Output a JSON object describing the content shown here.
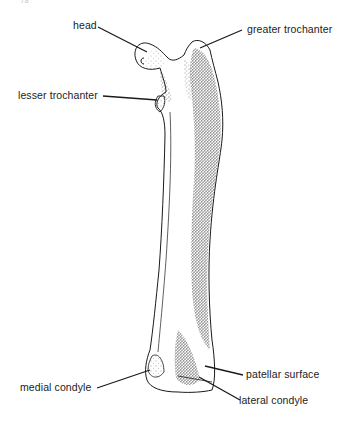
{
  "figure": {
    "view": "anterior",
    "page_mark": "78"
  },
  "labels": {
    "head": "head",
    "greater_trochanter": "greater trochanter",
    "lesser_trochanter": "lesser trochanter",
    "patellar_surface": "patellar surface",
    "medial_condyle": "medial condyle",
    "lateral_condyle": "lateral condyle"
  },
  "colors": {
    "ink": "#222222",
    "stipple": "#333333",
    "background": "#ffffff"
  }
}
